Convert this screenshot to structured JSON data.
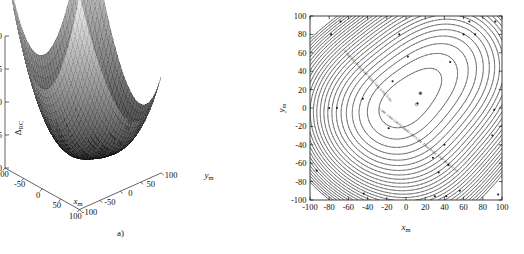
{
  "figure": {
    "panels": [
      {
        "id": "a",
        "caption": "a)",
        "type": "surface3d",
        "zlabel": "Δ",
        "zlabel_sub": "RC",
        "xlabel": "x",
        "xlabel_sub": "m",
        "ylabel": "y",
        "ylabel_sub": "m",
        "zticks": [
          "0",
          "5",
          "10",
          "15",
          "20"
        ],
        "xticks": [
          "-100",
          "-50",
          "0",
          "50",
          "100"
        ],
        "yticks": [
          "-100",
          "-50",
          "0",
          "50",
          "100"
        ]
      },
      {
        "id": "b",
        "caption": "b)",
        "type": "contour",
        "xlabel": "x",
        "xlabel_sub": "m",
        "ylabel": "y",
        "ylabel_sub": "m",
        "xticks": [
          "-100",
          "-80",
          "-60",
          "-40",
          "-20",
          "0",
          "20",
          "40",
          "60",
          "80",
          "100"
        ],
        "yticks": [
          "100",
          "80",
          "60",
          "40",
          "20",
          "0",
          "-20",
          "-40",
          "-60",
          "-80",
          "-100"
        ],
        "contour_labels_upper": [
          "12.993",
          "11.411",
          "10.493",
          "9.847",
          "8.884",
          "7.868",
          "6.978",
          "5.186"
        ],
        "contour_labels_lower": [
          "1.986",
          "2.986",
          "3.9873",
          "4.9888",
          "5.1987",
          "6.978",
          "7.868",
          "8.884",
          "9.847",
          "10.493",
          "11.411"
        ]
      }
    ]
  },
  "chart_data": [
    {
      "type": "surface",
      "title": "",
      "xlabel": "x_m",
      "ylabel": "y_m",
      "zlabel": "Δ_RC",
      "xlim": [
        -100,
        100
      ],
      "ylim": [
        -100,
        100
      ],
      "zlim": [
        0,
        20
      ],
      "xticks": [
        -100,
        -50,
        0,
        50,
        100
      ],
      "yticks": [
        -100,
        -50,
        0,
        50,
        100
      ],
      "zticks": [
        0,
        5,
        10,
        15,
        20
      ],
      "grid": false,
      "legend": "none",
      "description": "Bowl / saddle shaped mesh surface, high (approx 20) at far corners, dark low valley (approx 1-3) running diagonally through the centre",
      "z_min_approx": 1.5,
      "z_max_approx": 21,
      "mesh": true
    },
    {
      "type": "contour",
      "title": "",
      "xlabel": "x_m",
      "ylabel": "y_m",
      "xlim": [
        -100,
        100
      ],
      "ylim": [
        -100,
        100
      ],
      "xticks": [
        -100,
        -80,
        -60,
        -40,
        -20,
        0,
        20,
        40,
        60,
        80,
        100
      ],
      "yticks": [
        -100,
        -80,
        -60,
        -40,
        -20,
        0,
        20,
        40,
        60,
        80,
        100
      ],
      "grid": false,
      "legend": "none",
      "levels": [
        1.986,
        2.986,
        3.9873,
        4.9888,
        5.186,
        5.9906,
        6.978,
        7.868,
        8.884,
        9.847,
        10.493,
        11.411,
        12.993
      ],
      "minimum_at": [
        15,
        15
      ],
      "minimum_value": 1.5,
      "description": "Closed nested contours about a minimum near (15,15); values increase outward toward the lower-right and upper-left corners",
      "markers": [
        [
          -93,
          -68
        ],
        [
          -78,
          80
        ],
        [
          -68,
          94
        ],
        [
          -80,
          0
        ],
        [
          -72,
          0
        ],
        [
          -45,
          10
        ],
        [
          -44,
          -93
        ],
        [
          -18,
          -22
        ],
        [
          -14,
          29
        ],
        [
          -7,
          80
        ],
        [
          2,
          56
        ],
        [
          15,
          16
        ],
        [
          12,
          5
        ],
        [
          28,
          -54
        ],
        [
          34,
          -70
        ],
        [
          30,
          -96
        ],
        [
          40,
          -40
        ],
        [
          42,
          -96
        ],
        [
          44,
          -62
        ],
        [
          46,
          50
        ],
        [
          56,
          -90
        ],
        [
          60,
          80
        ],
        [
          66,
          94
        ],
        [
          72,
          80
        ],
        [
          90,
          -30
        ],
        [
          92,
          -2
        ],
        [
          93,
          94
        ],
        [
          96,
          -94
        ]
      ]
    }
  ]
}
